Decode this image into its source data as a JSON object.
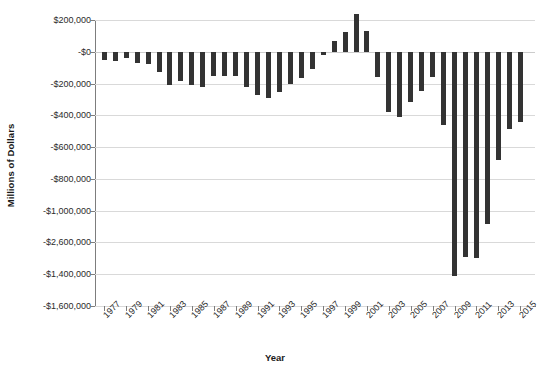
{
  "chart_data": {
    "type": "bar",
    "title": "",
    "xlabel": "Year",
    "ylabel": "Millions of Dollars",
    "ylim": [
      -1600000,
      200000
    ],
    "grid": true,
    "legend": "none",
    "y_tick_labels": [
      "$200,000",
      "-$0",
      "-$200,000",
      "-$400,000",
      "-$600,000",
      "-$800,000",
      "-$1,000,000",
      "-$2,600,000",
      "-$1,400,000",
      "-$1,600,000"
    ],
    "y_tick_values": [
      200000,
      0,
      -200000,
      -400000,
      -600000,
      -800000,
      -1000000,
      -1200000,
      -1400000,
      -1600000
    ],
    "x_tick_labels": [
      "1977",
      "1979",
      "1981",
      "1983",
      "1985",
      "1987",
      "1989",
      "1991",
      "1993",
      "1995",
      "1997",
      "1999",
      "2001",
      "2003",
      "2005",
      "2007",
      "2009",
      "2011",
      "2013",
      "2015"
    ],
    "categories": [
      "1977",
      "1978",
      "1979",
      "1980",
      "1981",
      "1982",
      "1983",
      "1984",
      "1985",
      "1986",
      "1987",
      "1988",
      "1989",
      "1990",
      "1991",
      "1992",
      "1993",
      "1994",
      "1995",
      "1996",
      "1997",
      "1998",
      "1999",
      "2000",
      "2001",
      "2002",
      "2003",
      "2004",
      "2005",
      "2006",
      "2007",
      "2008",
      "2009",
      "2010",
      "2011",
      "2012",
      "2013",
      "2014",
      "2015"
    ],
    "values": [
      -53659,
      -59186,
      -40726,
      -73830,
      -78968,
      -127977,
      -207802,
      -185367,
      -212308,
      -221227,
      -149730,
      -155178,
      -152639,
      -221036,
      -269238,
      -290321,
      -255051,
      -203186,
      -163952,
      -107431,
      -21884,
      69270,
      125610,
      236241,
      128236,
      -157758,
      -377585,
      -412727,
      -318346,
      -248181,
      -160701,
      -458553,
      -1412688,
      -1294373,
      -1299593,
      -1086966,
      -679775,
      -484600,
      -438899
    ],
    "bar_color": "#333333",
    "series_name": "Federal Surplus or Deficit"
  }
}
